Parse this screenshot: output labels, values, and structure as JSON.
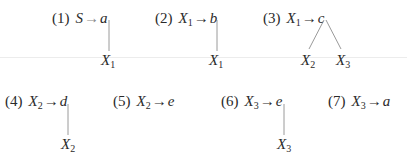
{
  "rules": [
    {
      "id": 1,
      "number": "(1)",
      "lhs": "S",
      "lhs_sub": "",
      "arrow": "→",
      "rhs": "a",
      "children": [
        {
          "sym": "X",
          "sub": "1"
        }
      ]
    },
    {
      "id": 2,
      "number": "(2)",
      "lhs": "X",
      "lhs_sub": "1",
      "arrow": "→",
      "rhs": "b",
      "children": [
        {
          "sym": "X",
          "sub": "1"
        }
      ]
    },
    {
      "id": 3,
      "number": "(3)",
      "lhs": "X",
      "lhs_sub": "1",
      "arrow": "→",
      "rhs": "c",
      "children": [
        {
          "sym": "X",
          "sub": "2"
        },
        {
          "sym": "X",
          "sub": "3"
        }
      ]
    },
    {
      "id": 4,
      "number": "(4)",
      "lhs": "X",
      "lhs_sub": "2",
      "arrow": "→",
      "rhs": "d",
      "children": [
        {
          "sym": "X",
          "sub": "2"
        }
      ]
    },
    {
      "id": 5,
      "number": "(5)",
      "lhs": "X",
      "lhs_sub": "2",
      "arrow": "→",
      "rhs": "e",
      "children": []
    },
    {
      "id": 6,
      "number": "(6)",
      "lhs": "X",
      "lhs_sub": "3",
      "arrow": "→",
      "rhs": "e",
      "children": [
        {
          "sym": "X",
          "sub": "3"
        }
      ]
    },
    {
      "id": 7,
      "number": "(7)",
      "lhs": "X",
      "lhs_sub": "3",
      "arrow": "→",
      "rhs": "a",
      "children": []
    }
  ],
  "colors": {
    "text": "#2a2a2a",
    "edge": "#9a9a9a",
    "divider": "#ececec"
  }
}
